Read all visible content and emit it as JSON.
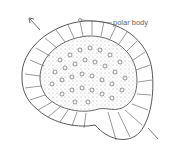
{
  "figure": {
    "labels": {
      "polar_body": "polar body"
    },
    "colors": {
      "line": "#444444",
      "stipple": "#9a9a9a",
      "label": "#666666",
      "background": "#ffffff"
    }
  }
}
